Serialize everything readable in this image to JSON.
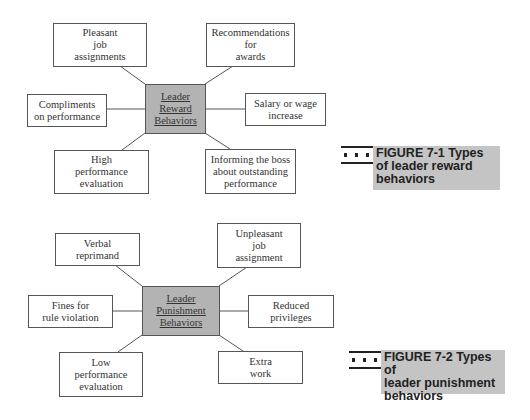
{
  "figures": [
    {
      "center": {
        "lines": [
          "Leader",
          "Reward",
          "Behaviors"
        ]
      },
      "nodes": [
        {
          "id": "pleasant-job-assignments",
          "lines": [
            "Pleasant",
            "job",
            "assignments"
          ]
        },
        {
          "id": "recommendations-for-awards",
          "lines": [
            "Recommendations",
            "for",
            "awards"
          ]
        },
        {
          "id": "compliments-on-performance",
          "lines": [
            "Compliments",
            "on performance"
          ]
        },
        {
          "id": "salary-or-wage-increase",
          "lines": [
            "Salary or wage",
            "increase"
          ]
        },
        {
          "id": "high-performance-evaluation",
          "lines": [
            "High",
            "performance",
            "evaluation"
          ]
        },
        {
          "id": "informing-the-boss",
          "lines": [
            "Informing the boss",
            "about outstanding",
            "performance"
          ]
        }
      ],
      "caption": {
        "label": "FIGURE 7-1",
        "lines": [
          "FIGURE 7-1  Types",
          "of leader reward",
          "behaviors"
        ]
      }
    },
    {
      "center": {
        "lines": [
          "Leader",
          "Punishment",
          "Behaviors"
        ]
      },
      "nodes": [
        {
          "id": "verbal-reprimand",
          "lines": [
            "Verbal",
            "reprimand"
          ]
        },
        {
          "id": "unpleasant-job-assignment",
          "lines": [
            "Unpleasant",
            "job",
            "assignment"
          ]
        },
        {
          "id": "fines-for-rule-violation",
          "lines": [
            "Fines for",
            "rule violation"
          ]
        },
        {
          "id": "reduced-privileges",
          "lines": [
            "Reduced",
            "privileges"
          ]
        },
        {
          "id": "low-performance-evaluation",
          "lines": [
            "Low",
            "performance",
            "evaluation"
          ]
        },
        {
          "id": "extra-work",
          "lines": [
            "Extra",
            "work"
          ]
        }
      ],
      "caption": {
        "label": "FIGURE 7-2",
        "lines": [
          "FIGURE 7-2  Types of",
          "leader punishment",
          "behaviors"
        ]
      }
    }
  ],
  "colors": {
    "center_fill": "#b3b3b3",
    "caption_fill": "#c4c4c4",
    "line": "#555555"
  }
}
